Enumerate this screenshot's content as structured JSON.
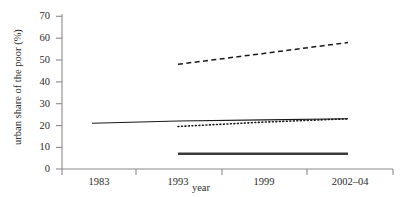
{
  "chart_data": {
    "type": "line",
    "title": "",
    "xlabel": "year",
    "ylabel": "urban share of the poor (%)",
    "x_categories": [
      "1983",
      "1993",
      "1999",
      "2002–04"
    ],
    "ylim": [
      0,
      70
    ],
    "y_ticks": [
      0,
      10,
      20,
      30,
      40,
      50,
      60,
      70
    ],
    "y_tick_labels": [
      "0",
      "10",
      "20",
      "30",
      "40",
      "50",
      "60",
      "70"
    ],
    "grid": false,
    "legend": "none",
    "series": [
      {
        "name": "dashed-upper-series",
        "style": "dashed",
        "color": "#1a1a1a",
        "x": [
          "1993",
          "1999",
          "2002–04"
        ],
        "values": [
          48,
          53,
          58
        ]
      },
      {
        "name": "solid-thin-series",
        "style": "solid",
        "color": "#1a1a1a",
        "x": [
          "1983",
          "1993",
          "1999",
          "2002–04"
        ],
        "values": [
          21,
          22,
          22.5,
          23
        ]
      },
      {
        "name": "dotted-series",
        "style": "dotted",
        "color": "#1a1a1a",
        "x": [
          "1993",
          "1999",
          "2002–04"
        ],
        "values": [
          19.5,
          21.5,
          23
        ]
      },
      {
        "name": "solid-thick-lower-series",
        "style": "solid-thick",
        "color": "#3a3a3a",
        "x": [
          "1993",
          "1999",
          "2002–04"
        ],
        "values": [
          7,
          7,
          7
        ]
      }
    ]
  },
  "axes": {
    "y_title": "urban share of the poor (%)",
    "x_title": "year",
    "y_tick_labels": [
      "70",
      "60",
      "50",
      "40",
      "30",
      "20",
      "10",
      "0"
    ],
    "x_tick_labels": [
      "1983",
      "1993",
      "1999",
      "2002–04"
    ]
  },
  "colors": {
    "axis": "#8a8a8a",
    "line": "#1a1a1a",
    "line_thick": "#3a3a3a",
    "text": "#2b2b2b",
    "background": "#ffffff"
  }
}
